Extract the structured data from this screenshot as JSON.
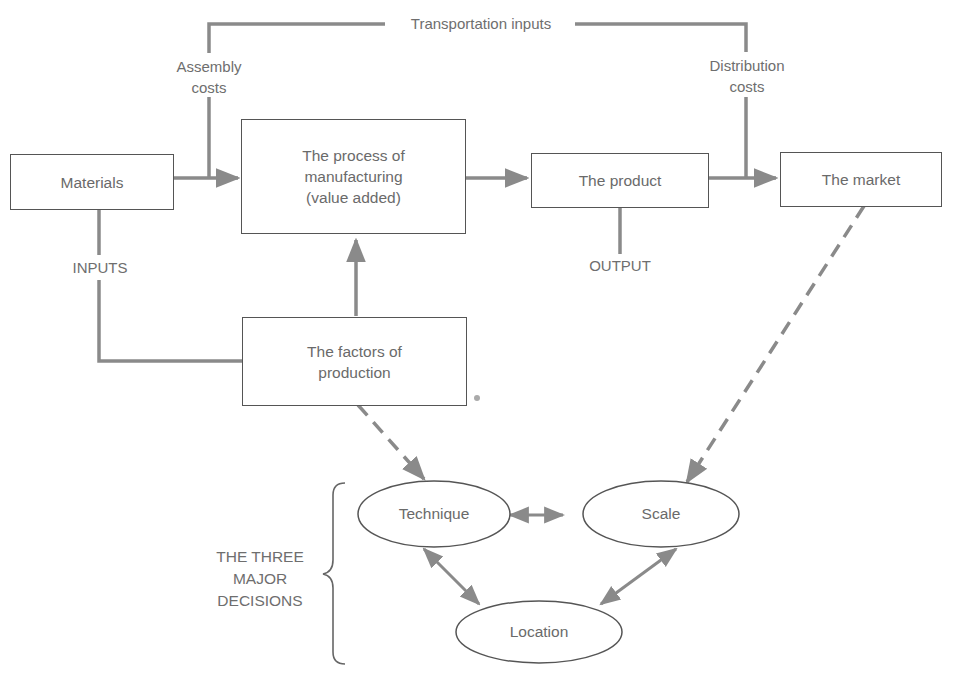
{
  "diagram": {
    "colors": {
      "line": "#8a8a8a",
      "border": "#555555",
      "text": "#6a6a6a"
    },
    "boxes": {
      "materials": "Materials",
      "process": [
        "The process of",
        "manufacturing",
        "(value added)"
      ],
      "product": "The product",
      "market": "The market",
      "factors": [
        "The factors of",
        "production"
      ]
    },
    "labels": {
      "transportation": "Transportation inputs",
      "assembly": [
        "Assembly",
        "costs"
      ],
      "distribution": [
        "Distribution",
        "costs"
      ],
      "inputs": "INPUTS",
      "output": "OUTPUT",
      "decisions": [
        "THE THREE",
        "MAJOR",
        "DECISIONS"
      ]
    },
    "ovals": {
      "technique": "Technique",
      "scale": "Scale",
      "location": "Location"
    }
  }
}
